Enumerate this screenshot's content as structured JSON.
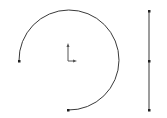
{
  "sketch": {
    "background": "#ffffff",
    "line_color": "#3a3a3a",
    "origin": {
      "x": 68,
      "y": 61,
      "axis_color": "#555555"
    },
    "arc": {
      "center": {
        "x": 68,
        "y": 61
      },
      "radius": 50,
      "start": {
        "x": 19,
        "y": 61
      },
      "end": {
        "x": 68,
        "y": 110
      },
      "sweep_degrees": 270
    },
    "line": {
      "start": {
        "x": 149,
        "y": 11
      },
      "mid": {
        "x": 149,
        "y": 61
      },
      "end": {
        "x": 149,
        "y": 110
      }
    }
  }
}
